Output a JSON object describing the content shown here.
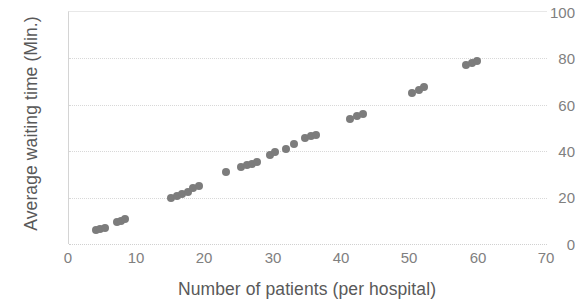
{
  "chart_data": {
    "type": "scatter",
    "title": "",
    "xlabel": "Number of patients (per hospital)",
    "ylabel": "Average waiting time (Min.)",
    "xlim": [
      0,
      70
    ],
    "ylim": [
      0,
      100
    ],
    "xticks": [
      0,
      10,
      20,
      30,
      40,
      50,
      60,
      70
    ],
    "yticks": [
      0,
      20,
      40,
      60,
      80,
      100
    ],
    "xtick_labels": [
      "0",
      "10",
      "20",
      "30",
      "40",
      "50",
      "60",
      "70"
    ],
    "ytick_labels": [
      "0",
      "20",
      "40",
      "60",
      "80",
      "100"
    ],
    "grid": "horizontal-dotted",
    "legend": null,
    "marker_color": "#7c7c7c",
    "marker_size": 8,
    "axis_color": "#d4d4d4",
    "tick_label_color": "#808080",
    "axis_title_color": "#595959",
    "series": [
      {
        "name": "hospitals",
        "points": [
          [
            4,
            6
          ],
          [
            4.6,
            6.5
          ],
          [
            5.2,
            7
          ],
          [
            7,
            9.5
          ],
          [
            7.6,
            10
          ],
          [
            8.2,
            10.8
          ],
          [
            15,
            20
          ],
          [
            15.8,
            20.5
          ],
          [
            16.6,
            21.5
          ],
          [
            17.4,
            22.5
          ],
          [
            18.2,
            24
          ],
          [
            19,
            25
          ],
          [
            23,
            31
          ],
          [
            25.2,
            33
          ],
          [
            26,
            34
          ],
          [
            26.8,
            34.5
          ],
          [
            27.6,
            35.5
          ],
          [
            29.4,
            38.5
          ],
          [
            30.2,
            39.5
          ],
          [
            31.8,
            41
          ],
          [
            33,
            43
          ],
          [
            34.6,
            45.5
          ],
          [
            35.4,
            46.5
          ],
          [
            36.2,
            47
          ],
          [
            41.2,
            54
          ],
          [
            42.2,
            55
          ],
          [
            43,
            56
          ],
          [
            50.2,
            65
          ],
          [
            51.2,
            66.5
          ],
          [
            52,
            67.5
          ],
          [
            58.2,
            77
          ],
          [
            59,
            78
          ],
          [
            59.8,
            79
          ]
        ]
      }
    ]
  }
}
